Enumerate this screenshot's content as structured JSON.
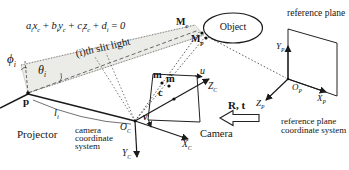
{
  "figure": {
    "type": "structured-light-system-geometry-diagram",
    "colors": {
      "ink": "#1a1a1a",
      "slit_band_fill": "#ebebe7",
      "background": "#ffffff"
    }
  },
  "labels": {
    "equation_segments": [
      {
        "t": "a",
        "s": "i"
      },
      {
        "t": "x",
        "s": "c"
      },
      {
        "t": " + "
      },
      {
        "t": "b",
        "s": "i"
      },
      {
        "t": "y",
        "s": "c"
      },
      {
        "t": " + "
      },
      {
        "t": "c",
        "s": "i"
      },
      {
        "t": "z",
        "s": "c"
      },
      {
        "t": " + "
      },
      {
        "t": "d",
        "s": "i"
      },
      {
        "t": " = 0"
      }
    ],
    "slit_light": "(i)th slit light",
    "phi": [
      {
        "t": "ϕ",
        "s": "i"
      }
    ],
    "theta": [
      {
        "t": "θ",
        "s": "i"
      }
    ],
    "p": "p",
    "l_i": [
      {
        "t": "l",
        "s": "i"
      }
    ],
    "projector": "Projector",
    "camera_cs": "camera coordinate system",
    "object": "Object",
    "m_c": [
      {
        "t": "M",
        "s": "c"
      }
    ],
    "m_p": [
      {
        "t": "M",
        "s": "p"
      }
    ],
    "m": "m",
    "m_tilde": "m̃",
    "c": "c",
    "u": "u",
    "v": "v",
    "o_c": [
      {
        "t": "O",
        "s": "C"
      }
    ],
    "x_c": [
      {
        "t": "X",
        "s": "C"
      }
    ],
    "y_c": [
      {
        "t": "Y",
        "s": "C"
      }
    ],
    "z_c": [
      {
        "t": "Z",
        "s": "C"
      }
    ],
    "camera": "Camera",
    "r_t": "R, t",
    "ref_plane": "reference plane",
    "ref_cs": "reference plane coordinate system",
    "o_p": [
      {
        "t": "O",
        "s": "P"
      }
    ],
    "x_p": [
      {
        "t": "X",
        "s": "P"
      }
    ],
    "y_p": [
      {
        "t": "Y",
        "s": "P"
      }
    ],
    "z_p": [
      {
        "t": "Z",
        "s": "P"
      }
    ]
  }
}
